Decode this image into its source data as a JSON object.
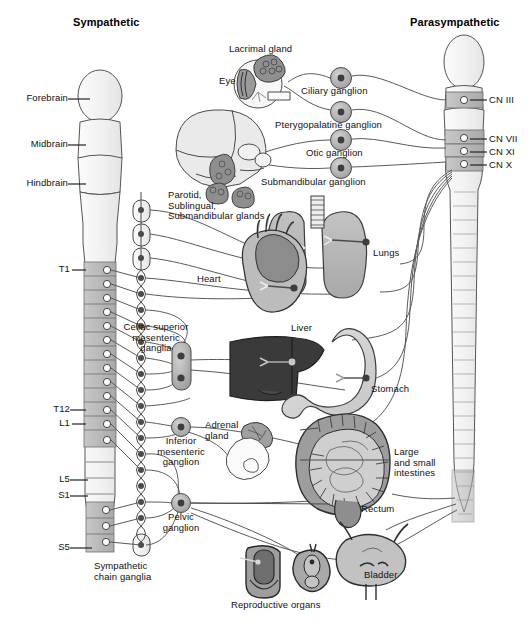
{
  "figure": {
    "type": "anatomical-diagram",
    "background": "#ffffff",
    "width": 530,
    "height": 622
  },
  "titles": {
    "left": "Sympathetic",
    "right": "Parasympathetic"
  },
  "brain_labels": [
    {
      "id": "forebrain",
      "text": "Forebrain",
      "x": 22,
      "y": 96
    },
    {
      "id": "midbrain",
      "text": "Midbrain",
      "x": 25,
      "y": 142
    },
    {
      "id": "hindbrain",
      "text": "Hindbrain",
      "x": 20,
      "y": 181
    }
  ],
  "spinal_labels": [
    {
      "id": "t1",
      "text": "T1",
      "x": 55,
      "y": 271
    },
    {
      "id": "t12",
      "text": "T12",
      "x": 47,
      "y": 407
    },
    {
      "id": "l1",
      "text": "L1",
      "x": 55,
      "y": 424
    },
    {
      "id": "l5",
      "text": "L5",
      "x": 53,
      "y": 478
    },
    {
      "id": "s1",
      "text": "S1",
      "x": 53,
      "y": 494
    },
    {
      "id": "s5",
      "text": "S5",
      "x": 53,
      "y": 545
    }
  ],
  "cranial_nerve_labels": [
    {
      "id": "cn3",
      "text": "CN III",
      "x": 489,
      "y": 101
    },
    {
      "id": "cn7",
      "text": "CN VII",
      "x": 489,
      "y": 140
    },
    {
      "id": "cn11",
      "text": "CN XI",
      "x": 489,
      "y": 152
    },
    {
      "id": "cn10",
      "text": "CN X",
      "x": 489,
      "y": 165
    }
  ],
  "parasympathetic_ganglia": [
    {
      "id": "ciliary",
      "text": "Ciliary ganglion",
      "cx": 341,
      "cy": 78,
      "lx": 308,
      "ly": 86
    },
    {
      "id": "pterygopalatine",
      "text": "Pterygopalatine ganglion",
      "cx": 341,
      "cy": 112,
      "lx": 282,
      "ly": 120
    },
    {
      "id": "otic",
      "text": "Otic ganglion",
      "cx": 341,
      "cy": 140,
      "lx": 310,
      "ly": 148
    },
    {
      "id": "submandibular",
      "text": "Submandibular ganglion",
      "cx": 341,
      "cy": 168,
      "lx": 266,
      "ly": 177
    }
  ],
  "sympathetic_ganglia": [
    {
      "id": "celiac",
      "text": "Celiac superior\nmesenteric\nganglia",
      "lx": 131,
      "ly": 326,
      "cx": 181,
      "cy": 365
    },
    {
      "id": "inferior-mesenteric",
      "text": "Inferior\nmesenteric\nganglion",
      "lx": 157,
      "ly": 438,
      "cx": 181,
      "cy": 427
    },
    {
      "id": "pelvic",
      "text": "Pelvic\nganglion",
      "lx": 165,
      "ly": 513,
      "cx": 181,
      "cy": 503
    },
    {
      "id": "chain",
      "text": "Sympathetic\nchain ganglia",
      "lx": 94,
      "ly": 563,
      "cx": 122,
      "cy": 545
    }
  ],
  "organ_labels": [
    {
      "id": "lacrimal-gland",
      "text": "Lacrimal gland",
      "x": 229,
      "y": 48
    },
    {
      "id": "eye",
      "text": "Eye",
      "x": 219,
      "y": 79
    },
    {
      "id": "salivary-glands",
      "text": "Parotid,\nSublingual,\nSubmandibular glands",
      "x": 168,
      "y": 194
    },
    {
      "id": "lungs",
      "text": "Lungs",
      "x": 373,
      "y": 251
    },
    {
      "id": "heart",
      "text": "Heart",
      "x": 197,
      "y": 278
    },
    {
      "id": "liver",
      "text": "Liver",
      "x": 291,
      "y": 327
    },
    {
      "id": "stomach",
      "text": "Stomach",
      "x": 371,
      "y": 388
    },
    {
      "id": "adrenal-gland",
      "text": "Adrenal\ngland",
      "x": 208,
      "y": 424
    },
    {
      "id": "intestines",
      "text": "Large\nand small\nintestines",
      "x": 394,
      "y": 455
    },
    {
      "id": "rectum",
      "text": "Rectum",
      "x": 361,
      "y": 507
    },
    {
      "id": "bladder",
      "text": "Bladder",
      "x": 364,
      "y": 573
    },
    {
      "id": "reproductive-organs",
      "text": "Reproductive organs",
      "x": 231,
      "y": 603
    }
  ],
  "colors": {
    "outline": "#4d4d4d",
    "dark_outline": "#2b2b2b",
    "nerve_line": "#5a5a5a",
    "segment_fill": "#b8b8b8",
    "segment_fill_light": "#ededed",
    "cord_fill": "#f4f4f4",
    "ganglion_fill": "#b0b0b0",
    "ganglion_core": "#4a4a4a",
    "lung_fill": "#b5b5b5",
    "heart_fill": "#bdbdbd",
    "heart_dark": "#8a8a8a",
    "liver_fill": "#3c3c3c",
    "stomach_fill": "#d6d6d6",
    "intestine_fill": "#9f9f9f",
    "intestine_light": "#cfcfcf",
    "bladder_fill": "#c4c4c4",
    "gland_fill": "#9c9c9c",
    "skull_fill": "#e8e8e8",
    "text": "#111111"
  }
}
